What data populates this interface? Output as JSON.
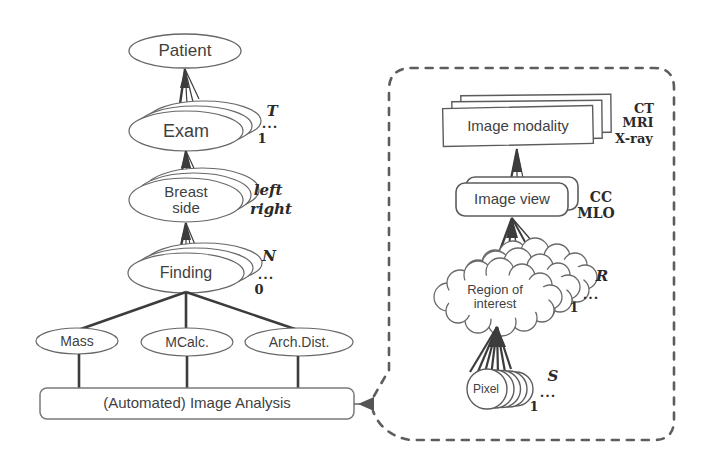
{
  "tree": {
    "patient": {
      "label": "Patient"
    },
    "exam": {
      "label": "Exam",
      "max": "T",
      "dots": "...",
      "min": "1"
    },
    "breast": {
      "label": "Breast side",
      "val_top": "left",
      "val_bottom": "right"
    },
    "finding": {
      "label": "Finding",
      "max": "N",
      "dots": "...",
      "min": "0"
    },
    "mass": {
      "label": "Mass"
    },
    "mcalc": {
      "label": "MCalc."
    },
    "archdist": {
      "label": "Arch.Dist."
    },
    "analysis": {
      "label": "(Automated) Image Analysis"
    }
  },
  "panel": {
    "modality": {
      "label": "Image modality",
      "v1": "CT",
      "v2": "MRI",
      "v3": "X-ray"
    },
    "view": {
      "label": "Image view",
      "v1": "CC",
      "v2": "MLO"
    },
    "roi": {
      "label": "Region of interest",
      "max": "R",
      "dots": "...",
      "min": "1"
    },
    "pixel": {
      "label": "Pixel",
      "max": "S",
      "dots": "...",
      "min": "1"
    }
  },
  "colors": {
    "ink": "#3c3c3c",
    "outline": "#676767",
    "dash_border": "#5d5d5d",
    "paper": "#ffffff"
  }
}
